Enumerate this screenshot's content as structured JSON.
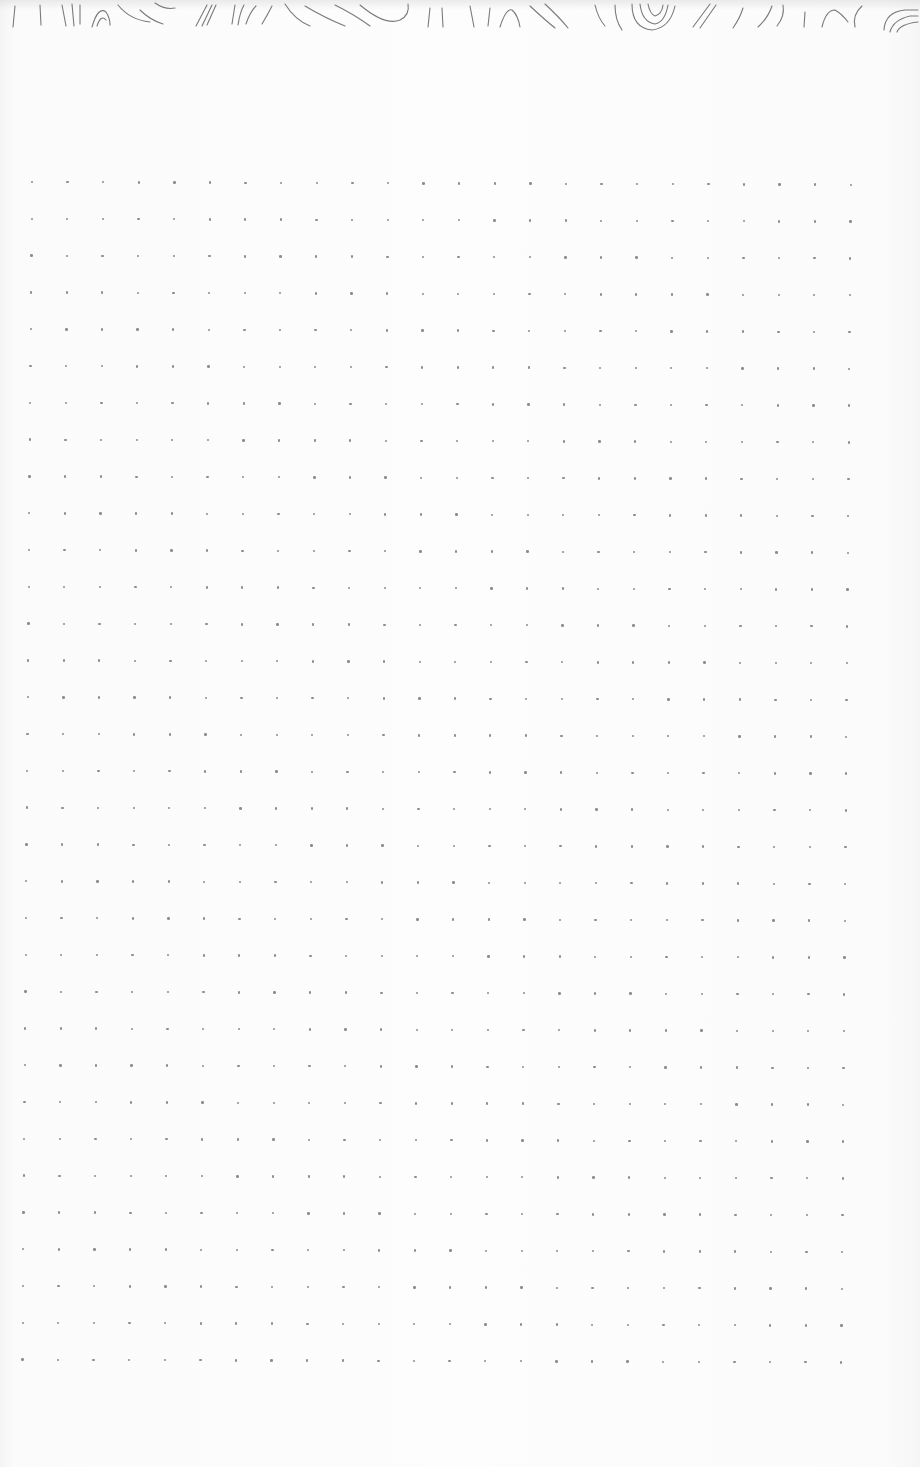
{
  "page": {
    "type": "dot-grid notebook page",
    "background_color": "#fbfbfb",
    "dot_color": "#8d8d8d",
    "header_art": "topographic-contour-lines"
  },
  "grid": {
    "columns": 24,
    "rows": 33,
    "origin_x": 32,
    "origin_y": 182,
    "spacing_x": 35.6,
    "spacing_y": 36.8,
    "skew_x_per_row": -0.3
  }
}
